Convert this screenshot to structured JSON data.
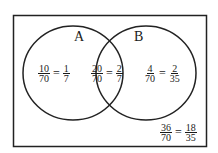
{
  "diagram": {
    "type": "venn",
    "sets": [
      {
        "label": "A"
      },
      {
        "label": "B"
      }
    ],
    "regions": {
      "a_only": {
        "num1": "10",
        "den1": "70",
        "num2": "1",
        "den2": "7"
      },
      "a_and_b": {
        "num1": "20",
        "den1": "70",
        "num2": "2",
        "den2": "7"
      },
      "b_only": {
        "num1": "4",
        "den1": "70",
        "num2": "2",
        "den2": "35"
      },
      "neither": {
        "num1": "36",
        "den1": "70",
        "num2": "18",
        "den2": "35"
      }
    },
    "equals": "="
  }
}
